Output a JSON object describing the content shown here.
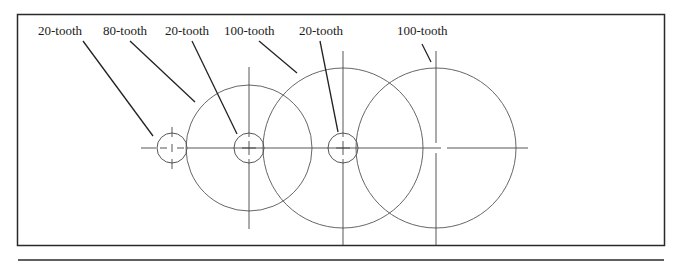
{
  "diagram": {
    "type": "gear-train-layout",
    "labels": [
      {
        "id": "gear1",
        "text": "20-tooth",
        "x": 38,
        "y": 26
      },
      {
        "id": "gear2",
        "text": "80-tooth",
        "x": 103,
        "y": 26
      },
      {
        "id": "gear3",
        "text": "20-tooth",
        "x": 165,
        "y": 26
      },
      {
        "id": "gear4",
        "text": "100-tooth",
        "x": 224,
        "y": 26
      },
      {
        "id": "gear5",
        "text": "20-tooth",
        "x": 299,
        "y": 26
      },
      {
        "id": "gear6",
        "text": "100-tooth",
        "x": 397,
        "y": 26
      }
    ],
    "gears": [
      {
        "name": "20-tooth",
        "cx": 172,
        "cy": 148,
        "r": 15
      },
      {
        "name": "80-tooth",
        "cx": 249,
        "cy": 148,
        "r": 63
      },
      {
        "name": "20-tooth",
        "cx": 249,
        "cy": 148,
        "r": 15
      },
      {
        "name": "100-tooth",
        "cx": 343,
        "cy": 148,
        "r": 80
      },
      {
        "name": "20-tooth",
        "cx": 343,
        "cy": 148,
        "r": 15
      },
      {
        "name": "100-tooth",
        "cx": 436,
        "cy": 148,
        "r": 80
      }
    ],
    "colors": {
      "stroke": "#333333",
      "frame": "#2a2a2a",
      "text": "#1a1a1a",
      "background": "#ffffff"
    }
  }
}
